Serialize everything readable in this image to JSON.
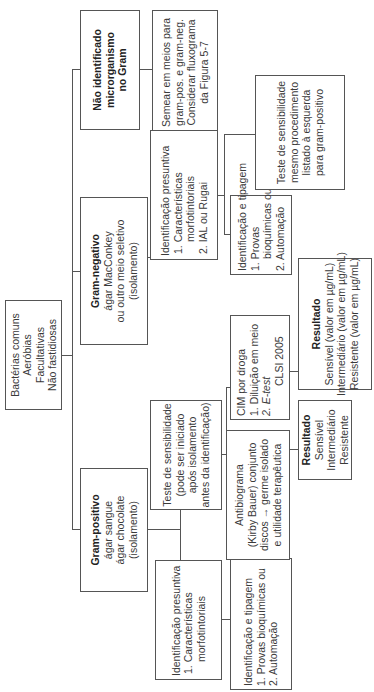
{
  "diagram": {
    "orientation": "rotated-90-ccw",
    "root": {
      "lines": [
        "Bactérias comuns",
        "Aeróbias",
        "Facultativas",
        "Não fastidiosas"
      ]
    },
    "gram_positive": {
      "title": "Gram-positivo",
      "lines": [
        "ágar sangue",
        "ágar chocolate",
        "(isolamento)"
      ],
      "presumptive_id": {
        "lines": [
          "Identificação presuntiva",
          "1. Características",
          "morfotintoriais"
        ]
      },
      "id_typing": {
        "lines": [
          "Identificação e tipagem",
          "1. Provas bioquímicas ou",
          "2. Automação"
        ]
      },
      "sensitivity_test": {
        "lines": [
          "Teste de sensibilidade",
          "(pode ser iniciado",
          "após isolamento",
          "antes da identificação)"
        ]
      },
      "mic": {
        "lines": [
          "CIM por droga",
          "1. Diluição em meio",
          "2. E-test",
          "CLSI 2005"
        ]
      },
      "mic_result": {
        "title": "Resultado",
        "lines": [
          "Sensível (valor em µg/mL)",
          "Intermediário (valor em µg/mL)",
          "Resistente (valor em µg/mL)"
        ]
      },
      "antibiogram": {
        "lines": [
          "Antibiograma",
          "(Kirby Bauer) conjunto",
          "discos → germe isolado",
          "e utilidade terapêutica"
        ]
      },
      "antibiogram_result": {
        "title": "Resultado",
        "lines": [
          "Sensível",
          "Intermediário",
          "Resistente"
        ]
      }
    },
    "gram_negative": {
      "title": "Gram-negativo",
      "lines": [
        "ágar MacConkey",
        "ou outro meio seletivo",
        "(isolamento)"
      ],
      "presumptive_id": {
        "lines": [
          "Identificação presuntiva",
          "1. Características",
          "morfotintoriais",
          "2. IAL ou Rugai"
        ]
      },
      "id_typing": {
        "lines": [
          "Identificação e tipagem",
          "1. Provas",
          "bioquímicas ou",
          "2. Automação"
        ]
      },
      "sensitivity_test": {
        "lines": [
          "Teste de sensibilidade",
          "mesmo procedimento",
          "listado à esquerda",
          "para gram-positivo"
        ]
      }
    },
    "unidentified": {
      "title_lines": [
        "Não identificado",
        "microrganismo",
        "no Gram"
      ],
      "action": {
        "lines": [
          "Semear em meios para",
          "gram-pos. e gram-neg.",
          "Considerar fluxograma",
          "da Figura 5-7"
        ]
      }
    }
  }
}
